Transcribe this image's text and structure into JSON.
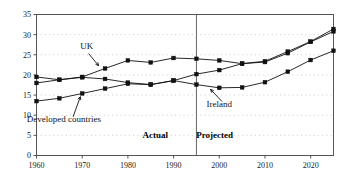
{
  "chart_data": {
    "type": "line",
    "title": "",
    "subtitle": "",
    "xlabel": "",
    "ylabel": "",
    "xlim": [
      1960,
      2025
    ],
    "ylim": [
      0,
      35
    ],
    "grid": true,
    "grid_style": "dotted-horizontal",
    "legend_position": "inline-annotations",
    "x": [
      1960,
      1965,
      1970,
      1975,
      1980,
      1985,
      1990,
      1995,
      2000,
      2005,
      2010,
      2015,
      2020,
      2025
    ],
    "y_ticks": [
      0,
      5,
      10,
      15,
      20,
      25,
      30,
      35
    ],
    "x_ticks": [
      1960,
      1970,
      1980,
      1990,
      2000,
      2010,
      2020
    ],
    "series": [
      {
        "name": "UK",
        "marker": "square",
        "color": "#111111",
        "values": [
          18.0,
          18.8,
          19.5,
          21.6,
          23.6,
          23.1,
          24.2,
          24.0,
          23.6,
          22.8,
          23.2,
          25.4,
          28.2,
          30.8
        ]
      },
      {
        "name": "Ireland",
        "marker": "square",
        "color": "#111111",
        "values": [
          19.5,
          18.8,
          19.4,
          19.0,
          18.1,
          17.6,
          18.6,
          17.6,
          16.8,
          16.9,
          18.2,
          20.8,
          23.7,
          26.0
        ]
      },
      {
        "name": "Developed countries",
        "marker": "square",
        "color": "#111111",
        "values": [
          13.5,
          14.2,
          15.4,
          16.6,
          17.8,
          17.6,
          18.6,
          20.2,
          21.2,
          22.8,
          23.4,
          25.8,
          28.3,
          31.4
        ]
      }
    ],
    "annotations": [
      {
        "name": "uk-label",
        "text": "UK",
        "x": 1971,
        "y": 26.5
      },
      {
        "name": "ireland-label",
        "text": "Ireland",
        "x": 2000,
        "y": 12.1
      },
      {
        "name": "developed-countries-label",
        "text": "Developed countries",
        "x": 1966,
        "y": 8.3
      }
    ],
    "divider": {
      "name": "actual-projected-divider",
      "x": 1995
    },
    "phase_labels": [
      {
        "name": "actual-label",
        "text": "Actual",
        "x": 1986,
        "y": 4.3
      },
      {
        "name": "projected-label",
        "text": "Projected",
        "x": 1999,
        "y": 4.3
      }
    ]
  },
  "axis": {
    "y_tick_labels": [
      "0",
      "5",
      "10",
      "15",
      "20",
      "25",
      "30",
      "35"
    ],
    "x_tick_labels": [
      "1960",
      "1970",
      "1980",
      "1990",
      "2000",
      "2010",
      "2020"
    ]
  },
  "colors": {
    "line": "#111111",
    "marker": "#111111",
    "grid": "#b4b4b4",
    "frame": "#555555",
    "divider": "#666666",
    "background": "#ffffff"
  }
}
